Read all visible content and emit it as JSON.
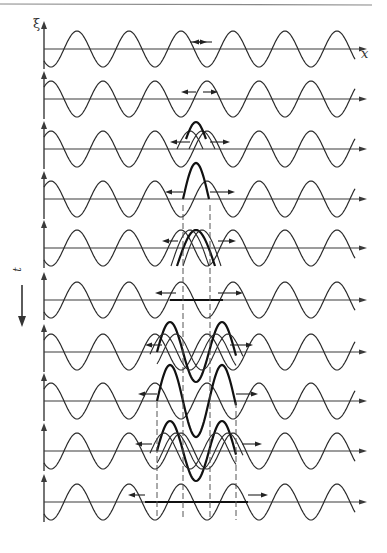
{
  "figure": {
    "axis_labels": {
      "vertical": "ξ",
      "horizontal": "x",
      "time": "t"
    },
    "colors": {
      "line": "#2a2a2a",
      "axis": "#3a3a3a",
      "dashed": "#555555",
      "top_rule": "#888888"
    },
    "layout": {
      "axis_x_start": 44,
      "axis_x_end": 367,
      "wave_x_end": 355,
      "period": 52,
      "amplitude": 18,
      "phase_peak_x": 77,
      "dash_lines_top": [
        {
          "x": 183,
          "y1": 205,
          "y2": 520
        },
        {
          "x": 210,
          "y1": 205,
          "y2": 520
        },
        {
          "x": 157,
          "y1": 402,
          "y2": 520
        },
        {
          "x": 236,
          "y1": 402,
          "y2": 520
        }
      ]
    },
    "rows": [
      {
        "y": 49,
        "invert": false,
        "pulse": "tiny",
        "arrows": [
          [
            190,
            207
          ],
          [
            212,
            192
          ]
        ]
      },
      {
        "y": 99,
        "invert": true,
        "pulse": "tiny-down",
        "arrows": [
          [
            196,
            181
          ],
          [
            203,
            218
          ]
        ]
      },
      {
        "y": 149,
        "invert": true,
        "pulse": "partial",
        "arrows": [
          [
            190,
            170
          ],
          [
            210,
            230
          ]
        ]
      },
      {
        "y": 199,
        "invert": true,
        "pulse": "full",
        "arrows": [
          [
            183,
            165
          ],
          [
            210,
            235
          ]
        ]
      },
      {
        "y": 248,
        "invert": false,
        "pulse": "double-partial",
        "arrows": [
          [
            178,
            162
          ],
          [
            218,
            236
          ]
        ]
      },
      {
        "y": 300,
        "invert": false,
        "pulse": "flat",
        "arrows": [
          [
            176,
            155
          ],
          [
            218,
            243
          ]
        ]
      },
      {
        "y": 352,
        "invert": true,
        "pulse": "wide-partial",
        "arrows": [
          [
            162,
            145
          ],
          [
            230,
            253
          ]
        ]
      },
      {
        "y": 401,
        "invert": true,
        "pulse": "wide-full",
        "arrows": [
          [
            157,
            138
          ],
          [
            236,
            258
          ]
        ]
      },
      {
        "y": 451,
        "invert": false,
        "pulse": "wide-double",
        "arrows": [
          [
            152,
            135
          ],
          [
            242,
            262
          ]
        ]
      },
      {
        "y": 502,
        "invert": false,
        "pulse": "wide-flat",
        "arrows": [
          [
            145,
            128
          ],
          [
            248,
            268
          ]
        ]
      }
    ]
  }
}
